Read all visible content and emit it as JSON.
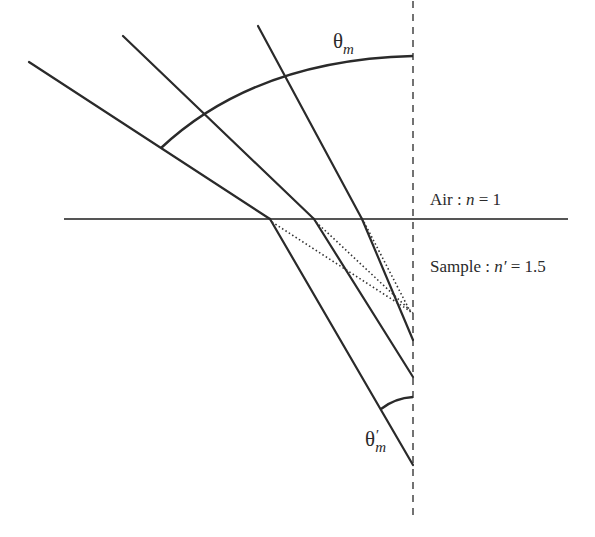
{
  "diagram": {
    "type": "refraction",
    "labels": {
      "theta_m": {
        "symbol": "θ",
        "subscript": "m"
      },
      "theta_m_prime": {
        "symbol": "θ",
        "prime": "′",
        "subscript": "m"
      },
      "air": {
        "name": "Air",
        "sep": " : ",
        "var": "n",
        "eq": " = 1"
      },
      "sample": {
        "name": "Sample",
        "sep": " : ",
        "var": "n′",
        "eq": " = 1.5"
      }
    },
    "media": [
      {
        "name": "Air",
        "refractive_index": 1
      },
      {
        "name": "Sample",
        "refractive_index": 1.5
      }
    ],
    "colors": {
      "line": "#2a2a2a",
      "background": "#ffffff"
    },
    "rays_count": 3
  }
}
